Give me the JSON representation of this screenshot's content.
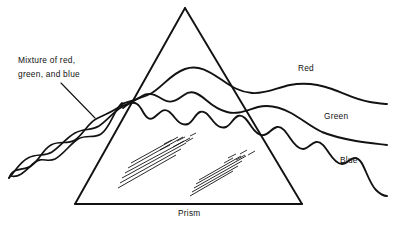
{
  "figure": {
    "background_color": "#ffffff",
    "ink_color": "#121212"
  },
  "labels": {
    "input_line1": "Mixture of red,",
    "input_line2": "green, and blue",
    "prism": "Prism",
    "red": "Red",
    "green": "Green",
    "blue": "Blue"
  },
  "diagram_data": {
    "type": "line-art-physics-diagram",
    "subject": "optical prism dispersion",
    "prism": {
      "shape": "triangle",
      "apex": [
        185,
        8
      ],
      "bottom_left": [
        75,
        204
      ],
      "bottom_right": [
        302,
        204
      ],
      "base_label_position": [
        178,
        215
      ]
    },
    "incoming_beam": {
      "description": "three intertwined waves forming a braid representing mixed white light",
      "strand_count": 3,
      "start": [
        8,
        178
      ],
      "entry_point": [
        122,
        104
      ]
    },
    "output_waves": [
      {
        "name": "Red",
        "wavelength_rank": "longest",
        "relative_wavelength": 30,
        "amplitude": 9,
        "label_position": [
          298,
          68
        ],
        "exit_y": 96,
        "end_y": 104
      },
      {
        "name": "Green",
        "wavelength_rank": "medium",
        "relative_wavelength": 19,
        "amplitude": 8,
        "label_position": [
          324,
          116
        ],
        "exit_y": 118,
        "end_y": 145
      },
      {
        "name": "Blue",
        "wavelength_rank": "shortest",
        "relative_wavelength": 11,
        "amplitude": 8,
        "label_position": [
          340,
          160
        ],
        "exit_y": 143,
        "end_y": 196
      }
    ],
    "glare_hatching": {
      "groups": 2,
      "description": "two clusters of parallel diagonal lines indicating glass glare"
    }
  }
}
